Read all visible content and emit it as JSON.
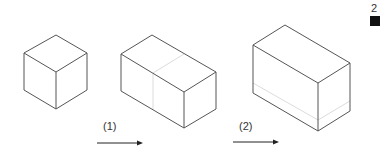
{
  "figure": {
    "steps": [
      {
        "label": "(1)"
      },
      {
        "label": "(2)"
      }
    ],
    "corner": {
      "page_number": "2",
      "marker_color": "#111111"
    },
    "colors": {
      "edge": "#555555",
      "hidden_line": "#dcdcdc",
      "arrow": "#222222"
    },
    "shapes": [
      {
        "name": "cube"
      },
      {
        "name": "cuboid-extended-length"
      },
      {
        "name": "cuboid-extended-height"
      }
    ]
  }
}
